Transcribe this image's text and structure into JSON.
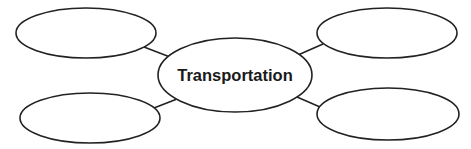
{
  "diagram": {
    "type": "concept-web",
    "stroke_color": "#222222",
    "fill_color": "#ffffff",
    "center": {
      "label": "Transportation",
      "cx": 235,
      "cy": 75,
      "rx": 77,
      "ry": 37
    },
    "nodes": [
      {
        "id": "top-left",
        "label": "",
        "cx": 86,
        "cy": 33,
        "rx": 70,
        "ry": 25
      },
      {
        "id": "top-right",
        "label": "",
        "cx": 387,
        "cy": 33,
        "rx": 70,
        "ry": 25
      },
      {
        "id": "bottom-left",
        "label": "",
        "cx": 90,
        "cy": 118,
        "rx": 70,
        "ry": 25
      },
      {
        "id": "bottom-right",
        "label": "",
        "cx": 388,
        "cy": 114,
        "rx": 71,
        "ry": 26
      }
    ],
    "edges": [
      {
        "from": "top-left",
        "to": "center",
        "x1": 144,
        "y1": 47,
        "x2": 170,
        "y2": 57
      },
      {
        "from": "top-right",
        "to": "center",
        "x1": 323,
        "y1": 44,
        "x2": 298,
        "y2": 55
      },
      {
        "from": "bottom-left",
        "to": "center",
        "x1": 154,
        "y1": 108,
        "x2": 177,
        "y2": 99
      },
      {
        "from": "bottom-right",
        "to": "center",
        "x1": 320,
        "y1": 107,
        "x2": 297,
        "y2": 97
      }
    ]
  }
}
